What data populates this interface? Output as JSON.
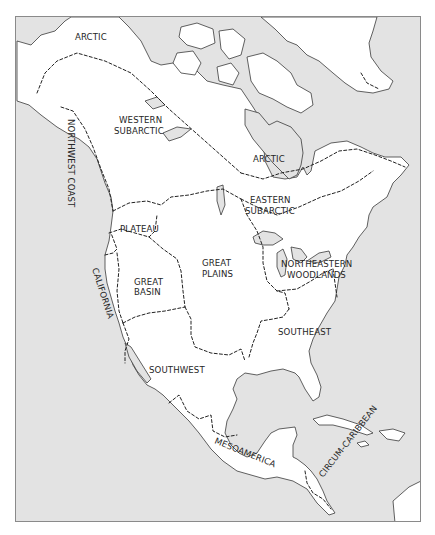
{
  "map": {
    "title": "Culture Areas of North America",
    "colors": {
      "water": "#e3e3e3",
      "land": "#ffffff",
      "outline": "#3a3a3a",
      "frame": "#8a8a8a",
      "text": "#262626"
    },
    "regions": [
      {
        "id": "arctic-nw",
        "lines": [
          "ARCTIC"
        ]
      },
      {
        "id": "western-subarctic",
        "lines": [
          "WESTERN",
          "SUBARCTIC"
        ]
      },
      {
        "id": "northwest-coast",
        "lines": [
          "NORTHWEST COAST"
        ]
      },
      {
        "id": "arctic-hudson",
        "lines": [
          "ARCTIC"
        ]
      },
      {
        "id": "eastern-subarctic",
        "lines": [
          "EASTERN",
          "SUBARCTIC"
        ]
      },
      {
        "id": "plateau",
        "lines": [
          "PLATEAU"
        ]
      },
      {
        "id": "california",
        "lines": [
          "CALIFORNIA"
        ]
      },
      {
        "id": "great-basin",
        "lines": [
          "GREAT",
          "BASIN"
        ]
      },
      {
        "id": "great-plains",
        "lines": [
          "GREAT",
          "PLAINS"
        ]
      },
      {
        "id": "northeastern-woodlands",
        "lines": [
          "NORTHEASTERN",
          "WOODLANDS"
        ]
      },
      {
        "id": "southeast",
        "lines": [
          "SOUTHEAST"
        ]
      },
      {
        "id": "southwest",
        "lines": [
          "SOUTHWEST"
        ]
      },
      {
        "id": "mesoamerica",
        "lines": [
          "MESOAMERICA"
        ]
      },
      {
        "id": "circum-caribbean",
        "lines": [
          "CIRCUM-CARIBBEAN"
        ]
      }
    ]
  }
}
